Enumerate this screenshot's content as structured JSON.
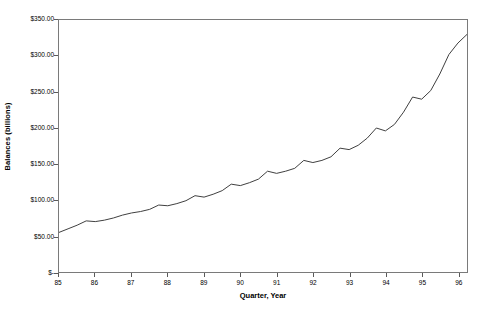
{
  "chart_data": {
    "type": "line",
    "title": "",
    "xlabel": "Quarter, Year",
    "ylabel": "Balances (billions)",
    "ylim": [
      0,
      350
    ],
    "y_tick_labels": [
      "$350.00",
      "$300.00",
      "$250.00",
      "$200.00",
      "$150.00",
      "$100.00",
      "$50.00",
      "$-"
    ],
    "y_tick_values": [
      350,
      300,
      250,
      200,
      150,
      100,
      50,
      0
    ],
    "x_tick_labels": [
      "85",
      "86",
      "87",
      "88",
      "89",
      "90",
      "91",
      "92",
      "93",
      "94",
      "95",
      "96"
    ],
    "x_tick_values": [
      1985,
      1986,
      1987,
      1988,
      1989,
      1990,
      1991,
      1992,
      1993,
      1994,
      1995,
      1996
    ],
    "xlim": [
      1985,
      1996.25
    ],
    "grid": false,
    "legend": "none",
    "line_color": "#404040",
    "series": [
      {
        "name": "Balances",
        "x": [
          1985.0,
          1985.25,
          1985.5,
          1985.75,
          1986.0,
          1986.25,
          1986.5,
          1986.75,
          1987.0,
          1987.25,
          1987.5,
          1987.75,
          1988.0,
          1988.25,
          1988.5,
          1988.75,
          1989.0,
          1989.25,
          1989.5,
          1989.75,
          1990.0,
          1990.25,
          1990.5,
          1990.75,
          1991.0,
          1991.25,
          1991.5,
          1991.75,
          1992.0,
          1992.25,
          1992.5,
          1992.75,
          1993.0,
          1993.25,
          1993.5,
          1993.75,
          1994.0,
          1994.25,
          1994.5,
          1994.75,
          1995.0,
          1995.25,
          1995.5,
          1995.75,
          1996.0,
          1996.25
        ],
        "values": [
          55,
          60,
          65,
          71,
          70,
          72,
          75,
          79,
          82,
          84,
          87,
          93,
          92,
          95,
          99,
          106,
          104,
          108,
          113,
          122,
          120,
          124,
          129,
          140,
          137,
          140,
          144,
          155,
          152,
          155,
          160,
          172,
          170,
          176,
          186,
          200,
          196,
          205,
          222,
          243,
          240,
          252,
          275,
          302,
          318,
          330
        ]
      }
    ]
  }
}
